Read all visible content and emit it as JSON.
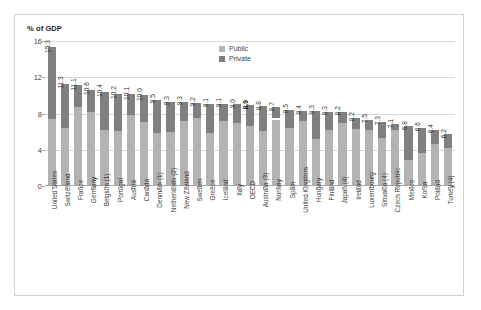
{
  "chart_data": {
    "type": "bar",
    "title": "% of GDP",
    "xlabel": "",
    "ylabel": "% of GDP",
    "ylim": [
      0,
      16
    ],
    "yticks": [
      0,
      4,
      8,
      12,
      16
    ],
    "grid": true,
    "stacked": true,
    "legend_position": "top-center",
    "legend": [
      "Public",
      "Private"
    ],
    "highlight_category": "OECD",
    "colors": {
      "public": "#b3b3b3",
      "private": "#808080",
      "gridline": "#d9d9d9",
      "axis": "#a6a6a6",
      "frame": "#d0d0d0",
      "text": "#3f3f3f"
    },
    "categories": [
      "United States",
      "Switzerland",
      "France",
      "Germany",
      "Belgium (1)",
      "Portugal",
      "Austria",
      "Canada",
      "Denmark (1)",
      "Netherlands (2)",
      "New Zealand",
      "Sweden",
      "Greece",
      "Iceland",
      "Italy",
      "OECD",
      "Australia (3)",
      "Norway",
      "Spain",
      "United Kingdom",
      "Hungary",
      "Finland",
      "Japan (4)",
      "Ireland",
      "Luxembourg",
      "Slovakia (4)",
      "Czech Republic",
      "Mexico",
      "Korea",
      "Poland",
      "Turkey (4)"
    ],
    "total_labels": [
      "15.3",
      "11.3",
      "11.1",
      "10.6",
      "10.4",
      "10.2",
      "10.1",
      "10.0",
      "9.5",
      "9.3",
      "9.3",
      "9.2",
      "9.1",
      "9.1",
      "9.0",
      "8.9",
      "8.8",
      "8.7",
      "8.5",
      "8.4",
      "8.3",
      "8.3",
      "8.2",
      "8.2",
      "7.5",
      "7.3",
      "7.1",
      "6.8",
      "6.6",
      "6.4",
      "6.2",
      "5.7"
    ],
    "values": [
      15.3,
      11.3,
      11.1,
      10.6,
      10.4,
      10.2,
      10.1,
      10.0,
      9.5,
      9.3,
      9.3,
      9.2,
      9.1,
      9.1,
      9.0,
      8.9,
      8.8,
      8.7,
      8.4,
      8.3,
      8.3,
      8.2,
      8.2,
      7.5,
      7.3,
      7.1,
      6.8,
      6.6,
      6.4,
      6.2,
      5.7
    ],
    "series": [
      {
        "name": "Public",
        "values": [
          7.4,
          6.4,
          8.7,
          8.2,
          6.2,
          6.1,
          7.8,
          7.1,
          5.8,
          6.0,
          7.2,
          7.5,
          5.8,
          7.2,
          6.9,
          6.6,
          6.1,
          7.3,
          6.4,
          7.2,
          5.2,
          6.2,
          6.9,
          6.3,
          6.2,
          5.3,
          6.2,
          2.9,
          3.6,
          4.6,
          4.2
        ]
      },
      {
        "name": "Private",
        "values": [
          7.9,
          4.9,
          2.4,
          2.4,
          4.2,
          4.1,
          2.3,
          2.9,
          3.7,
          3.3,
          2.1,
          1.7,
          3.3,
          1.9,
          2.1,
          2.3,
          2.7,
          1.2,
          2.0,
          1.1,
          3.1,
          2.0,
          1.3,
          1.2,
          1.1,
          1.8,
          0.6,
          3.7,
          2.8,
          1.6,
          1.5
        ]
      }
    ]
  }
}
